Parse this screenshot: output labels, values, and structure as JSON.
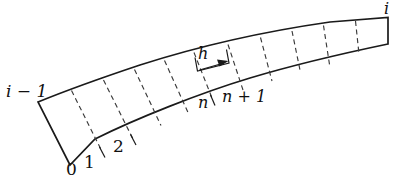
{
  "figure": {
    "stroke_color": "#1a1a1a",
    "dashed_color": "#3a3a3a",
    "background_color": "#ffffff",
    "labels": {
      "left_end": "i − 1",
      "right_end": "i",
      "node_0": "0",
      "node_1": "1",
      "node_2": "2",
      "node_n": "n",
      "node_n_plus_1": "n + 1",
      "spacing": "h"
    },
    "geometry": {
      "type": "curved-band",
      "cell_count": 11,
      "dashed_divider_count": 10,
      "left_edge": {
        "x1": 38,
        "y1": 102,
        "x2": 70,
        "y2": 165
      },
      "right_edge": {
        "x1": 388,
        "y1": 18,
        "x2": 388,
        "y2": 44
      },
      "top_curve_points": [
        [
          38,
          102
        ],
        [
          80,
          85
        ],
        [
          130,
          67
        ],
        [
          185,
          52
        ],
        [
          245,
          38
        ],
        [
          310,
          26
        ],
        [
          388,
          18
        ]
      ],
      "bottom_curve_points": [
        [
          70,
          165
        ],
        [
          105,
          147
        ],
        [
          150,
          128
        ],
        [
          205,
          110
        ],
        [
          265,
          94
        ],
        [
          325,
          76
        ],
        [
          388,
          44
        ]
      ]
    }
  }
}
